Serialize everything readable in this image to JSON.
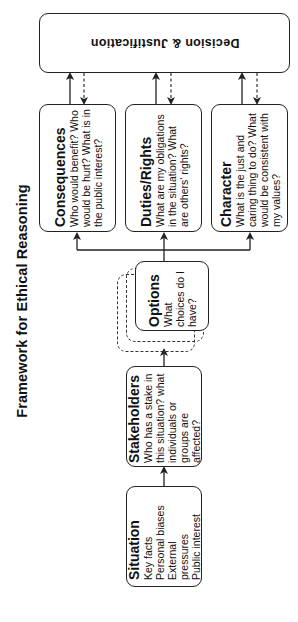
{
  "title": "Framework for Ethical Reasoning",
  "decision": {
    "label": "Decision & Justification"
  },
  "steps": {
    "situation": {
      "title": "Situation",
      "lines": [
        "Key facts",
        "Personal biases",
        "External pressures",
        "Public interest"
      ]
    },
    "stakeholders": {
      "title": "Stakeholders",
      "body": "Who has a stake in this situation? what individuals or groups are affected?"
    },
    "options": {
      "title": "Options",
      "body": "What choices do I have?"
    }
  },
  "lenses": [
    {
      "title": "Consequences",
      "body": "Who would benefit? Who would be hurt? What is in the public interest?"
    },
    {
      "title": "Duties/Rights",
      "body": "What are my obligations in the situation? What are others' rights?"
    },
    {
      "title": "Character",
      "body": "What is the just and caring thing to do? What would be consistent with my values?"
    }
  ],
  "colors": {
    "stroke": "#222222",
    "background": "#ffffff",
    "text": "#111111"
  }
}
